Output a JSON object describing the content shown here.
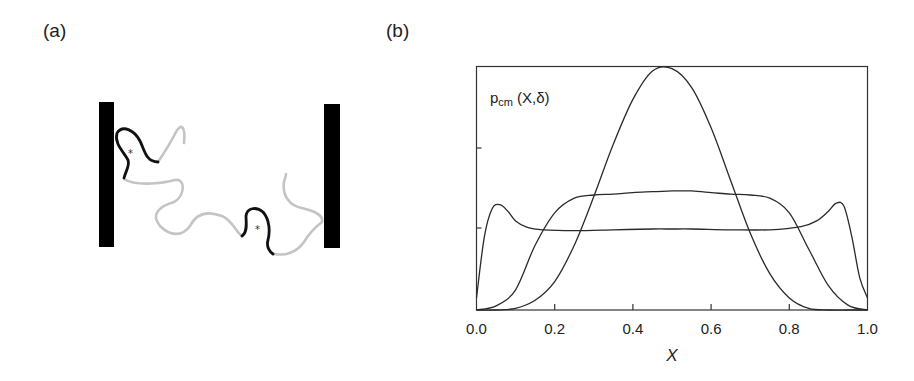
{
  "panels": {
    "a": {
      "label": "(a)"
    },
    "b": {
      "label": "(b)"
    }
  },
  "diagram_a": {
    "description": "Polymer chain confined between two parallel walls with two highlighted (black) segments marked by asterisks",
    "walls": [
      "left-wall",
      "right-wall"
    ],
    "markers": [
      "*",
      "*"
    ]
  },
  "chart_data": {
    "type": "line",
    "title": "",
    "xlabel": "X",
    "ylabel": "p_cm (X,δ)",
    "ylabel_main": "p",
    "ylabel_sub": "cm",
    "ylabel_args": "(X,δ)",
    "xlim": [
      0.0,
      1.0
    ],
    "ylim": [
      0,
      3
    ],
    "grid": false,
    "legend": "none",
    "x_ticks": [
      "0.0",
      "0.2",
      "0.4",
      "0.6",
      "0.8",
      "1.0"
    ],
    "y_ticks_unlabeled": [
      1,
      2
    ],
    "series": [
      {
        "name": "peaked (narrow confinement)",
        "x": [
          0.0,
          0.05,
          0.1,
          0.15,
          0.2,
          0.25,
          0.3,
          0.35,
          0.4,
          0.45,
          0.5,
          0.55,
          0.6,
          0.65,
          0.7,
          0.75,
          0.8,
          0.85,
          0.9,
          0.95,
          1.0
        ],
        "y": [
          0.0,
          0.0,
          0.02,
          0.12,
          0.35,
          0.8,
          1.4,
          2.05,
          2.6,
          2.95,
          2.98,
          2.75,
          2.25,
          1.6,
          0.95,
          0.45,
          0.15,
          0.02,
          0.0,
          0.0,
          0.0
        ]
      },
      {
        "name": "plateau (intermediate)",
        "x": [
          0.0,
          0.05,
          0.1,
          0.15,
          0.2,
          0.25,
          0.3,
          0.35,
          0.4,
          0.45,
          0.5,
          0.55,
          0.6,
          0.65,
          0.7,
          0.75,
          0.8,
          0.85,
          0.9,
          0.95,
          1.0
        ],
        "y": [
          0.0,
          0.05,
          0.25,
          0.8,
          1.2,
          1.38,
          1.42,
          1.43,
          1.45,
          1.46,
          1.47,
          1.47,
          1.45,
          1.43,
          1.42,
          1.38,
          1.2,
          0.75,
          0.3,
          0.06,
          0.0
        ]
      },
      {
        "name": "wall-peaked (wide)",
        "x": [
          0.0,
          0.02,
          0.04,
          0.06,
          0.08,
          0.1,
          0.13,
          0.17,
          0.25,
          0.35,
          0.45,
          0.5,
          0.55,
          0.65,
          0.75,
          0.83,
          0.87,
          0.9,
          0.92,
          0.94,
          0.96,
          0.98,
          1.0
        ],
        "y": [
          0.15,
          0.9,
          1.25,
          1.3,
          1.22,
          1.1,
          1.02,
          0.99,
          0.98,
          0.99,
          1.0,
          1.0,
          1.0,
          0.99,
          0.99,
          1.03,
          1.1,
          1.22,
          1.32,
          1.28,
          0.9,
          0.4,
          0.15
        ]
      }
    ]
  }
}
